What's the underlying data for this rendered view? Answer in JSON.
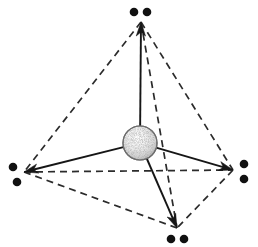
{
  "figure": {
    "background_color": "#ffffff",
    "width": 258,
    "height": 247
  },
  "central_atom": {
    "label": "central-atom",
    "cx": 140,
    "cy": 143,
    "r": 17,
    "fill_color": "#e8e8e8",
    "edge_color": "#5d5d5d",
    "style": "stippled-sphere"
  },
  "vertices": [
    {
      "id": "top",
      "label": "top-vertex",
      "x": 141,
      "y": 22,
      "pair_orientation": "horizontal"
    },
    {
      "id": "left",
      "label": "left-vertex",
      "x": 24,
      "y": 172,
      "pair_orientation": "vertical"
    },
    {
      "id": "right",
      "label": "right-vertex",
      "x": 233,
      "y": 170,
      "pair_orientation": "vertical"
    },
    {
      "id": "bottom",
      "label": "bottom-vertex",
      "x": 177,
      "y": 228,
      "pair_orientation": "horizontal"
    }
  ],
  "bonds": [
    {
      "id": "bond-center-top",
      "from": "center",
      "to": "top",
      "style": "solid",
      "arrow": true,
      "color": "#161616"
    },
    {
      "id": "bond-center-left",
      "from": "center",
      "to": "left",
      "style": "solid",
      "arrow": true,
      "color": "#161616"
    },
    {
      "id": "bond-center-right",
      "from": "center",
      "to": "right",
      "style": "solid",
      "arrow": true,
      "color": "#161616"
    },
    {
      "id": "bond-center-bottom",
      "from": "center",
      "to": "bottom",
      "style": "solid",
      "arrow": true,
      "color": "#161616"
    }
  ],
  "edges": [
    {
      "id": "edge-top-left",
      "from": "top",
      "to": "left",
      "style": "dashed",
      "color": "#2b2b2b"
    },
    {
      "id": "edge-top-right",
      "from": "top",
      "to": "right",
      "style": "dashed",
      "color": "#2b2b2b"
    },
    {
      "id": "edge-top-bottom",
      "from": "top",
      "to": "bottom",
      "style": "dashed",
      "color": "#2b2b2b"
    },
    {
      "id": "edge-left-right",
      "from": "left",
      "to": "right",
      "style": "dashed",
      "color": "#2b2b2b"
    },
    {
      "id": "edge-left-bottom",
      "from": "left",
      "to": "bottom",
      "style": "dashed",
      "color": "#2b2b2b"
    },
    {
      "id": "edge-right-bottom",
      "from": "right",
      "to": "bottom",
      "style": "dashed",
      "color": "#2b2b2b"
    }
  ],
  "lone_pairs": [
    {
      "vertex": "top",
      "dots": [
        {
          "cx": 134,
          "cy": 12
        },
        {
          "cx": 147,
          "cy": 12
        }
      ],
      "r": 4.3,
      "color": "#111111"
    },
    {
      "vertex": "left",
      "dots": [
        {
          "cx": 13,
          "cy": 167
        },
        {
          "cx": 17,
          "cy": 182
        }
      ],
      "r": 4.3,
      "color": "#111111"
    },
    {
      "vertex": "right",
      "dots": [
        {
          "cx": 244,
          "cy": 164
        },
        {
          "cx": 244,
          "cy": 179
        }
      ],
      "r": 4.3,
      "color": "#111111"
    },
    {
      "vertex": "bottom",
      "dots": [
        {
          "cx": 171,
          "cy": 239
        },
        {
          "cx": 184,
          "cy": 239
        }
      ],
      "r": 4.3,
      "color": "#111111"
    }
  ]
}
